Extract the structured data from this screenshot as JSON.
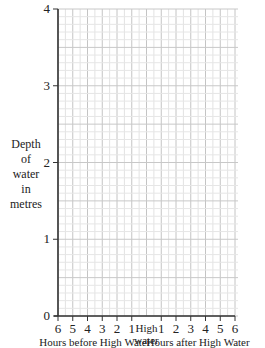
{
  "chart_data": {
    "type": "line",
    "title": "",
    "xlabel_left": "Hours before High Water",
    "xlabel_center": [
      "High",
      "water"
    ],
    "xlabel_right": "Hours after High Water",
    "ylabel": [
      "Depth",
      "of",
      "water",
      "in",
      "metres"
    ],
    "x_ticks_before": [
      "6",
      "5",
      "4",
      "3",
      "2",
      "1"
    ],
    "x_ticks_after": [
      "1",
      "2",
      "3",
      "4",
      "5",
      "6"
    ],
    "y_ticks": [
      "0",
      "1",
      "2",
      "3",
      "4"
    ],
    "ylim": [
      0,
      4
    ],
    "xlim": [
      -6,
      6
    ],
    "grid": true,
    "series": []
  }
}
